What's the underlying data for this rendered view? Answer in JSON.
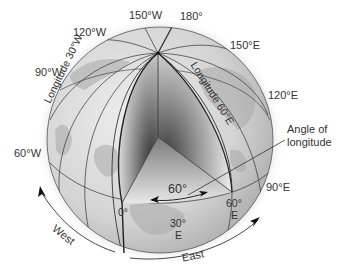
{
  "diagram": {
    "meridian_labels": {
      "w150": "150°W",
      "w120": "120°W",
      "w90": "90°W",
      "w60": "60°W",
      "m180": "180°",
      "e150": "150°E",
      "e120": "120°E",
      "e90": "90°E",
      "prime": "0°",
      "e60_num": "60°",
      "e60_dir": "E",
      "e30_num": "30°",
      "e30_dir": "E"
    },
    "line_labels": {
      "longitude_30w": "Longitude 30°W",
      "longitude_60e": "Longitude 60°E"
    },
    "angle": {
      "value": "60°",
      "callout_line1": "Angle of",
      "callout_line2": "longitude"
    },
    "directions": {
      "west": "West",
      "east": "East"
    },
    "colors": {
      "globe_light": "#e6e6e6",
      "globe_dark": "#9a9a9a",
      "line": "#222222",
      "wedge_dark": "#3a3a3a"
    }
  }
}
